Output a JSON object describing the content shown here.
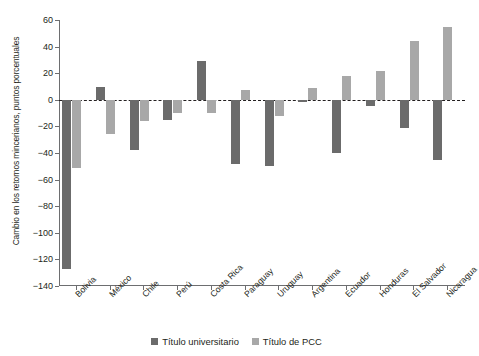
{
  "chart_data": {
    "type": "bar",
    "title": "",
    "xlabel": "",
    "ylabel": "Cambio en los retornos mincerianos, puntos porcentuales",
    "ylim": [
      -140,
      60
    ],
    "yticks": [
      60,
      40,
      20,
      0,
      -20,
      -40,
      -60,
      -80,
      -100,
      -120,
      -140
    ],
    "ytick_labels": [
      "60",
      "40",
      "20",
      "0",
      "−20",
      "−40",
      "−60",
      "−80",
      "−100",
      "−120",
      "−140"
    ],
    "grid": false,
    "zero_line": true,
    "legend_position": "bottom",
    "categories": [
      "Bolivia",
      "México",
      "Chile",
      "Perú",
      "Costa Rica",
      "Paraguay",
      "Uruguay",
      "Argentina",
      "Ecuador",
      "Honduras",
      "El Salvador",
      "Nicaragua"
    ],
    "series": [
      {
        "name": "Título universitario",
        "color": "#6b6b6b",
        "values": [
          -127,
          10,
          -38,
          -15,
          29,
          -48,
          -50,
          -2,
          -40,
          -5,
          -21,
          -45
        ]
      },
      {
        "name": "Título de PCC",
        "color": "#a8a8a8",
        "values": [
          -51,
          -26,
          -16,
          -10,
          -10,
          7,
          -12,
          9,
          18,
          22,
          44,
          55
        ]
      }
    ]
  },
  "legend": {
    "items": [
      {
        "label": "Título universitario",
        "color": "#6b6b6b"
      },
      {
        "label": "Título de PCC",
        "color": "#a8a8a8"
      }
    ]
  }
}
